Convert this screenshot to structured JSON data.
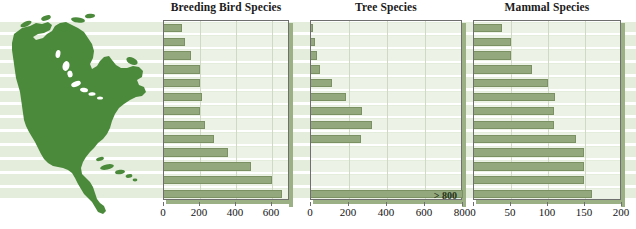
{
  "figure": {
    "map": {
      "name": "North America",
      "fill_color": "#4a8a3a"
    },
    "band_color": "#e4ecdc",
    "bar_color": "#93a87c",
    "bar_edge_color": "#7b9164",
    "row_count": 13
  },
  "chart_data": [
    {
      "type": "bar",
      "orientation": "horizontal",
      "title": "Breeding Bird Species",
      "xlabel": "",
      "ylabel": "",
      "xlim": [
        0,
        700
      ],
      "ticks": [
        0,
        200,
        400,
        600
      ],
      "tick_labels": [
        "0",
        "200",
        "400",
        "600"
      ],
      "grid": true,
      "legend": "none",
      "categories": [
        "1",
        "2",
        "3",
        "4",
        "5",
        "6",
        "7",
        "8",
        "9",
        "10",
        "11",
        "12",
        "13"
      ],
      "values": [
        100,
        115,
        150,
        200,
        200,
        210,
        200,
        225,
        280,
        355,
        485,
        600,
        655
      ]
    },
    {
      "type": "bar",
      "orientation": "horizontal",
      "title": "Tree Species",
      "xlabel": "",
      "ylabel": "",
      "xlim": [
        0,
        800
      ],
      "ticks": [
        0,
        200,
        400,
        600,
        800
      ],
      "tick_labels": [
        "0",
        "200",
        "400",
        "600",
        "800"
      ],
      "grid": true,
      "legend": "none",
      "categories": [
        "1",
        "2",
        "3",
        "4",
        "5",
        "6",
        "7",
        "8",
        "9",
        "10",
        "11",
        "12",
        "13"
      ],
      "values": [
        8,
        20,
        30,
        48,
        110,
        185,
        270,
        320,
        265,
        0,
        0,
        0,
        800
      ],
      "annotations": [
        {
          "row": 13,
          "text": "> 800"
        }
      ]
    },
    {
      "type": "bar",
      "orientation": "horizontal",
      "title": "Mammal Species",
      "xlabel": "",
      "ylabel": "",
      "xlim": [
        0,
        200
      ],
      "ticks": [
        0,
        50,
        100,
        150,
        200
      ],
      "tick_labels": [
        "0",
        "50",
        "100",
        "150",
        "200"
      ],
      "grid": true,
      "legend": "none",
      "categories": [
        "1",
        "2",
        "3",
        "4",
        "5",
        "6",
        "7",
        "8",
        "9",
        "10",
        "11",
        "12",
        "13"
      ],
      "values": [
        38,
        50,
        50,
        79,
        100,
        109,
        108,
        108,
        138,
        149,
        148,
        148,
        160
      ]
    }
  ]
}
